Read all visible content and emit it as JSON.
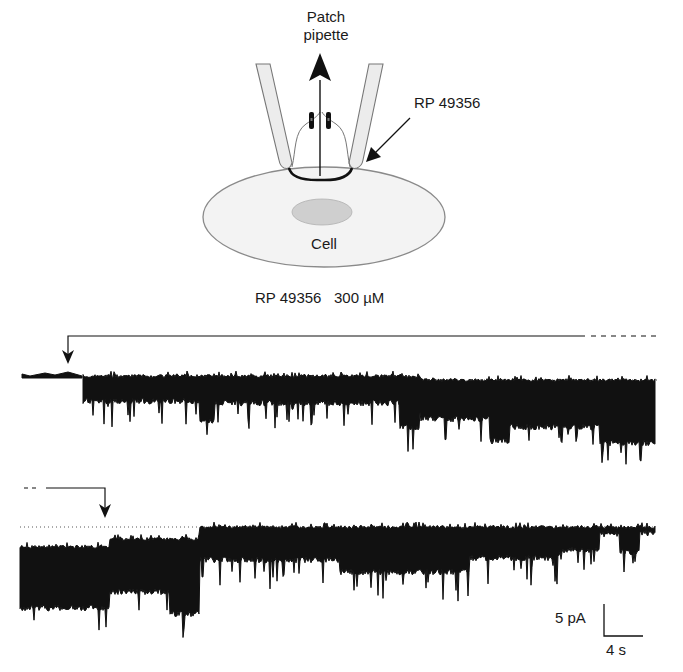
{
  "diagram": {
    "labels": {
      "pipette_line1": "Patch",
      "pipette_line2": "pipette",
      "compound": "RP 49356",
      "cell": "Cell"
    }
  },
  "recording": {
    "drug_label": "RP 49356   300 µM",
    "scale_bar": {
      "current": "5 pA",
      "time": "4 s"
    },
    "traces": [
      {
        "name": "trace-1",
        "baseline_y": 376,
        "drug_onset_x": 68
      },
      {
        "name": "trace-2",
        "baseline_y": 500,
        "drug_offset_x": 105
      }
    ]
  },
  "colors": {
    "ink": "#111111",
    "pipette_fill": "#ededed",
    "cell_fill": "#f3f3f3",
    "cell_stroke": "#8a8a8a",
    "nucleus_fill": "#cfcfcf"
  }
}
